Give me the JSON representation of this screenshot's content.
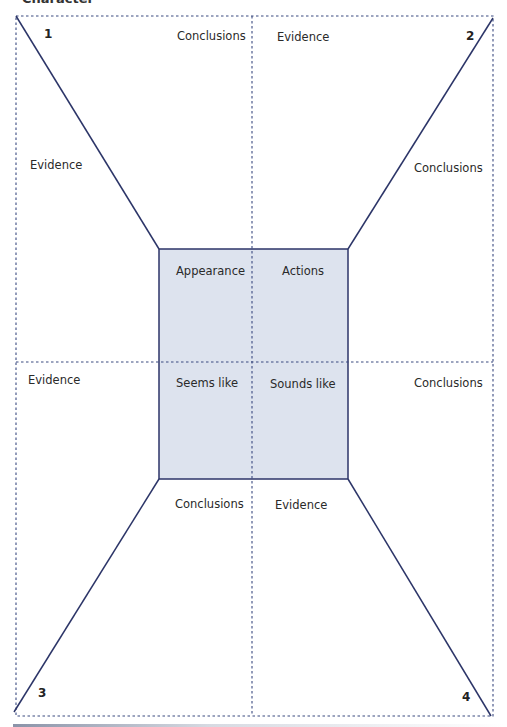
{
  "header": {
    "cut_title": "Character"
  },
  "corners": {
    "n1": "1",
    "n2": "2",
    "n3": "3",
    "n4": "4"
  },
  "center": {
    "top_left": "Appearance",
    "top_right": "Actions",
    "bottom_left": "Seems like",
    "bottom_right": "Sounds like",
    "fill_color": "#dde3ee",
    "border_color": "#2c3568"
  },
  "outer_labels": {
    "top_left_quadrant": "Conclusions",
    "top_right_quadrant": "Evidence",
    "left_upper": "Evidence",
    "right_upper": "Conclusions",
    "left_lower": "Evidence",
    "right_lower": "Conclusions",
    "bottom_left_quadrant": "Conclusions",
    "bottom_right_quadrant": "Evidence"
  },
  "colors": {
    "line": "#2c3568",
    "dashed": "#3a4a80"
  }
}
